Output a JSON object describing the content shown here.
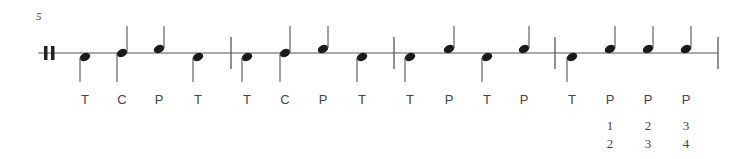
{
  "score": {
    "measure_number": "5",
    "staff": {
      "y": 53,
      "x_start": 38,
      "x_end": 718,
      "color": "#555555"
    },
    "start_repeat": {
      "x1": 46,
      "x2": 53
    },
    "barlines": [
      231,
      394,
      555,
      718
    ],
    "notes": [
      {
        "x": 85,
        "pos": "low",
        "label": "T"
      },
      {
        "x": 122,
        "pos": "mid",
        "label": "C"
      },
      {
        "x": 159,
        "pos": "high",
        "label": "P"
      },
      {
        "x": 198,
        "pos": "low",
        "label": "T"
      },
      {
        "x": 247,
        "pos": "low",
        "label": "T"
      },
      {
        "x": 285,
        "pos": "mid",
        "label": "C"
      },
      {
        "x": 323,
        "pos": "high",
        "label": "P"
      },
      {
        "x": 362,
        "pos": "low",
        "label": "T"
      },
      {
        "x": 410,
        "pos": "low",
        "label": "T"
      },
      {
        "x": 449,
        "pos": "high",
        "label": "P"
      },
      {
        "x": 487,
        "pos": "low",
        "label": "T"
      },
      {
        "x": 524,
        "pos": "high",
        "label": "P"
      },
      {
        "x": 572,
        "pos": "low",
        "label": "T"
      },
      {
        "x": 610,
        "pos": "high",
        "label": "P",
        "fingering": [
          "1",
          "2"
        ]
      },
      {
        "x": 648,
        "pos": "high",
        "label": "P",
        "fingering": [
          "2",
          "3"
        ]
      },
      {
        "x": 686,
        "pos": "high",
        "label": "P",
        "fingering": [
          "3",
          "4"
        ]
      }
    ],
    "label_y": 104,
    "fingering_y": [
      130,
      148
    ]
  }
}
